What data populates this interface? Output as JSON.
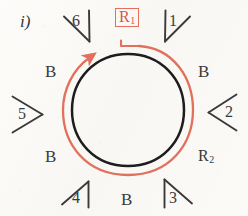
{
  "figure": {
    "index_label": "i)",
    "background_color": "#fbfaf7",
    "ring_color": "#222222",
    "highlight_color": "#e2705c",
    "text_color": "#3a3a3c"
  },
  "ring": {
    "center_x": 128,
    "center_y": 110,
    "inner_radius": 56,
    "outer_radius": 65,
    "arrow_direction": "clockwise",
    "arrowhead_angle_deg": 131
  },
  "region_labels": {
    "r1": {
      "text": "R",
      "subscript": "1",
      "boxed": true,
      "color": "#cf5a4a"
    },
    "r2": {
      "text": "R",
      "subscript": "2",
      "boxed": false,
      "color": "#37373a"
    }
  },
  "boundary_labels": [
    {
      "id": "b-top-left",
      "text": "B"
    },
    {
      "id": "b-top-right",
      "text": "B"
    },
    {
      "id": "b-bottom-left",
      "text": "B"
    },
    {
      "id": "b-bottom",
      "text": "B"
    }
  ],
  "angle_markers": [
    {
      "id": "marker-1",
      "label": "1",
      "position": "top-right"
    },
    {
      "id": "marker-2",
      "label": "2",
      "position": "right"
    },
    {
      "id": "marker-3",
      "label": "3",
      "position": "bottom-right"
    },
    {
      "id": "marker-4",
      "label": "4",
      "position": "bottom-left"
    },
    {
      "id": "marker-5",
      "label": "5",
      "position": "left"
    },
    {
      "id": "marker-6",
      "label": "6",
      "position": "top-left"
    }
  ]
}
